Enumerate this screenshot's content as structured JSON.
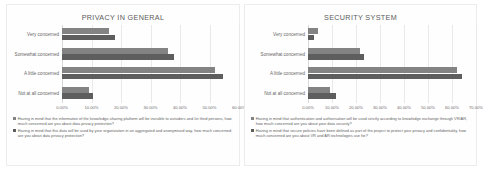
{
  "chart_data": [
    {
      "type": "bar",
      "orientation": "horizontal",
      "title": "PRIVACY IN GENERAL",
      "categories": [
        "Very concerned",
        "Somewhat concerned",
        "A little concerned",
        "Not at all concerned"
      ],
      "series": [
        {
          "name": "Having in mind that the information of the knowledge-sharing platform will be invisible to outsiders and /or third persons, how much concerned are you about data privacy protection?",
          "color": "#838383",
          "values": [
            16.0,
            36.0,
            52.0,
            9.0
          ]
        },
        {
          "name": "Having in mind that this data will be used by your organization in an aggregated and anonymised way, how much concerned are you about data privacy protection?",
          "color": "#5e5e5e",
          "values": [
            18.0,
            38.0,
            54.5,
            10.5
          ]
        }
      ],
      "xlabel": "",
      "ylabel": "",
      "xlim": [
        0,
        60
      ],
      "xticks": [
        "0.00%",
        "10.00%",
        "20.00%",
        "30.00%",
        "40.00%",
        "50.00%",
        "60.00%"
      ],
      "xtick_values": [
        0,
        10,
        20,
        30,
        40,
        50,
        60
      ],
      "grid": true,
      "legend_position": "bottom"
    },
    {
      "type": "bar",
      "orientation": "horizontal",
      "title": "SECURITY SYSTEM",
      "categories": [
        "Very concerned",
        "Somewhat concerned",
        "A little concerned",
        "Not at all concerned"
      ],
      "series": [
        {
          "name": "Having in mind that authentication and authorisation will be used strictly according to knowledge exchange through VR/AR, how much concerned are you about your data security?",
          "color": "#838383",
          "values": [
            4.0,
            21.5,
            62.0,
            9.0
          ]
        },
        {
          "name": "Having in mind that secure policies have been defined as part of the project to protect your privacy and confidentiality, how much concerned are you about VR and AR technologies use for?",
          "color": "#5e5e5e",
          "values": [
            2.5,
            23.5,
            64.0,
            11.5
          ]
        }
      ],
      "xlabel": "",
      "ylabel": "",
      "xlim": [
        0,
        70
      ],
      "xticks": [
        "0.00%",
        "10.00%",
        "20.00%",
        "30.00%",
        "40.00%",
        "50.00%",
        "60.00%",
        "70.00%"
      ],
      "xtick_values": [
        0,
        10,
        20,
        30,
        40,
        50,
        60,
        70
      ],
      "grid": true,
      "legend_position": "bottom"
    }
  ]
}
